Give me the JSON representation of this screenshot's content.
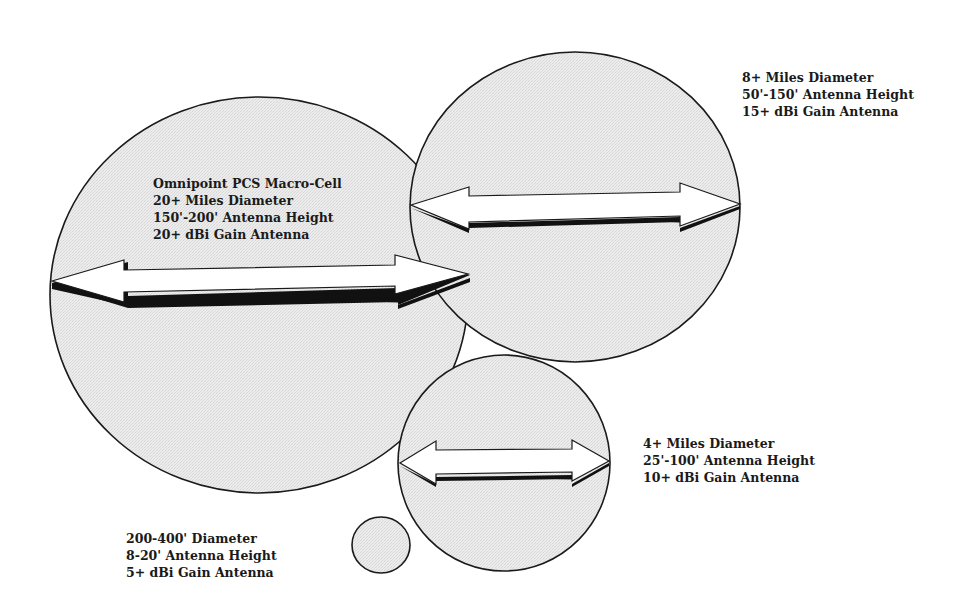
{
  "colors": {
    "background": "#ffffff",
    "cell_fill": "#e9e9e9",
    "outline": "#1a1a1a",
    "arrow_fill": "#ffffff",
    "arrow_shadow": "#111111"
  },
  "cells": [
    {
      "id": "macro-cell",
      "label_lines": [
        "Omnipoint PCS Macro-Cell",
        "20+ Miles Diameter",
        "150'-200' Antenna Height",
        "20+ dBi Gain Antenna"
      ],
      "diameter": "20+ Miles Diameter",
      "antenna_height": "150'-200' Antenna Height",
      "antenna_gain": "20+ dBi Gain Antenna"
    },
    {
      "id": "8-mile-cell",
      "label_lines": [
        "8+ Miles Diameter",
        "50'-150' Antenna Height",
        "15+ dBi Gain Antenna"
      ],
      "diameter": "8+ Miles Diameter",
      "antenna_height": "50'-150' Antenna Height",
      "antenna_gain": "15+ dBi Gain Antenna"
    },
    {
      "id": "4-mile-cell",
      "label_lines": [
        "4+ Miles Diameter",
        "25'-100' Antenna Height",
        "10+ dBi Gain Antenna"
      ],
      "diameter": "4+ Miles Diameter",
      "antenna_height": "25'-100' Antenna Height",
      "antenna_gain": "10+ dBi Gain Antenna"
    },
    {
      "id": "micro-cell",
      "label_lines": [
        "200-400' Diameter",
        "8-20' Antenna Height",
        "5+ dBi Gain Antenna"
      ],
      "diameter": "200-400' Diameter",
      "antenna_height": "8-20' Antenna Height",
      "antenna_gain": "5+ dBi Gain Antenna"
    }
  ]
}
